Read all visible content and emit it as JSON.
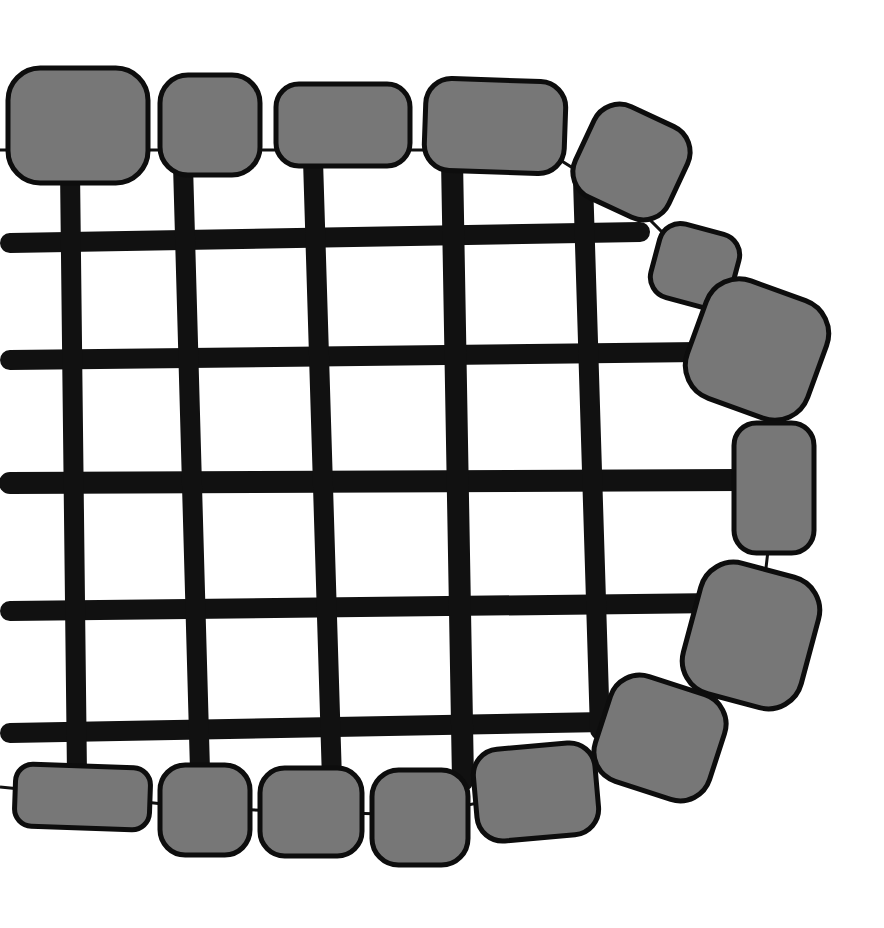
{
  "illustration": {
    "title": "Grid with stone border",
    "colors": {
      "background": "#ffffff",
      "bar": "#111111",
      "stone_fill": "#777777",
      "stone_stroke": "#0d0d0d",
      "string": "#111111"
    },
    "horizontal_bars": [
      {
        "x1": 10,
        "y1": 243,
        "x2": 640,
        "y2": 232,
        "w": 20
      },
      {
        "x1": 10,
        "y1": 360,
        "x2": 700,
        "y2": 352,
        "w": 20
      },
      {
        "x1": 10,
        "y1": 483,
        "x2": 740,
        "y2": 480,
        "w": 22
      },
      {
        "x1": 10,
        "y1": 611,
        "x2": 720,
        "y2": 603,
        "w": 20
      },
      {
        "x1": 10,
        "y1": 733,
        "x2": 605,
        "y2": 722,
        "w": 20
      }
    ],
    "vertical_bars": [
      {
        "x1": 70,
        "y1": 170,
        "x2": 77,
        "y2": 775,
        "w": 20
      },
      {
        "x1": 183,
        "y1": 165,
        "x2": 200,
        "y2": 770,
        "w": 20
      },
      {
        "x1": 313,
        "y1": 160,
        "x2": 332,
        "y2": 780,
        "w": 20
      },
      {
        "x1": 452,
        "y1": 160,
        "x2": 463,
        "y2": 780,
        "w": 22
      },
      {
        "x1": 583,
        "y1": 180,
        "x2": 600,
        "y2": 730,
        "w": 20
      }
    ],
    "stones": [
      {
        "x": 8,
        "y": 68,
        "w": 140,
        "h": 115,
        "rot": 0
      },
      {
        "x": 160,
        "y": 75,
        "w": 100,
        "h": 100,
        "rot": 0
      },
      {
        "x": 276,
        "y": 84,
        "w": 134,
        "h": 82,
        "rot": 0
      },
      {
        "x": 425,
        "y": 80,
        "w": 140,
        "h": 92,
        "rot": 2
      },
      {
        "x": 580,
        "y": 112,
        "w": 103,
        "h": 100,
        "rot": 25
      },
      {
        "x": 654,
        "y": 228,
        "w": 82,
        "h": 76,
        "rot": 15
      },
      {
        "x": 693,
        "y": 287,
        "w": 128,
        "h": 125,
        "rot": 20
      },
      {
        "x": 734,
        "y": 423,
        "w": 80,
        "h": 130,
        "rot": 0
      },
      {
        "x": 690,
        "y": 568,
        "w": 122,
        "h": 135,
        "rot": 15
      },
      {
        "x": 600,
        "y": 683,
        "w": 120,
        "h": 110,
        "rot": 18
      },
      {
        "x": 475,
        "y": 746,
        "w": 122,
        "h": 92,
        "rot": -5
      },
      {
        "x": 372,
        "y": 770,
        "w": 96,
        "h": 95,
        "rot": 0
      },
      {
        "x": 260,
        "y": 768,
        "w": 102,
        "h": 88,
        "rot": 0
      },
      {
        "x": 160,
        "y": 765,
        "w": 90,
        "h": 90,
        "rot": 0
      },
      {
        "x": 15,
        "y": 766,
        "w": 135,
        "h": 62,
        "rot": 2
      }
    ]
  }
}
